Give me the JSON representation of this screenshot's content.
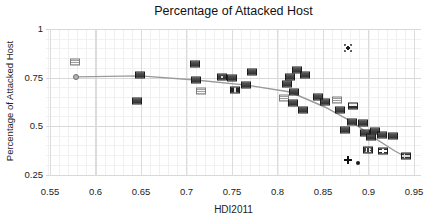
{
  "chart": {
    "title": "Percentage of Attacked Host",
    "xlabel": "HDI2011",
    "ylabel": "Percentage of Attacked Host",
    "x_tick_labels": [
      "0.55",
      "0.6",
      "0.65",
      "0.7",
      "0.75",
      "0.8",
      "0.85",
      "0.9",
      "0.95"
    ],
    "y_tick_labels": [
      "1",
      "0.75",
      "0.5",
      "0.25"
    ],
    "colors": {
      "background": "#ffffff",
      "grid_minor": "#f0f0f0",
      "grid_major": "#dcdcdc",
      "trend_line": "#9a9a9a",
      "text": "#1a1a1a",
      "flag_dark": "#3d3d3d",
      "flag_light": "#eeeeee"
    }
  },
  "chart_data": {
    "type": "scatter",
    "title": "Percentage of Attacked Host",
    "xlabel": "HDI2011",
    "ylabel": "Percentage of Attacked Host",
    "xlim": [
      0.545,
      0.958
    ],
    "ylim": [
      0.2425,
      1.0
    ],
    "x_ticks": [
      0.55,
      0.6,
      0.65,
      0.7,
      0.75,
      0.8,
      0.85,
      0.9,
      0.95
    ],
    "y_ticks": [
      1,
      0.75,
      0.5,
      0.25
    ],
    "grid": "on",
    "legend": "none",
    "marker_style": "country-flag-icons",
    "trend_line": {
      "color": "#9a9a9a",
      "points": [
        [
          0.579,
          0.753
        ],
        [
          0.649,
          0.758
        ],
        [
          0.71,
          0.737
        ],
        [
          0.766,
          0.711
        ],
        [
          0.814,
          0.675
        ],
        [
          0.852,
          0.598
        ],
        [
          0.882,
          0.521
        ],
        [
          0.905,
          0.443
        ],
        [
          0.929,
          0.371
        ],
        [
          0.943,
          0.335
        ]
      ]
    },
    "points": [
      {
        "x": 0.577,
        "y": 0.83,
        "marker": "flag-hstripes-light"
      },
      {
        "x": 0.579,
        "y": 0.753,
        "marker": "circle"
      },
      {
        "x": 0.649,
        "y": 0.763,
        "marker": "flag-dark"
      },
      {
        "x": 0.646,
        "y": 0.629,
        "marker": "flag-dark"
      },
      {
        "x": 0.709,
        "y": 0.82,
        "marker": "flag-dark"
      },
      {
        "x": 0.71,
        "y": 0.737,
        "marker": "flag-dark"
      },
      {
        "x": 0.716,
        "y": 0.68,
        "marker": "flag-hstripes-light"
      },
      {
        "x": 0.739,
        "y": 0.753,
        "marker": "flag-dark-emblem"
      },
      {
        "x": 0.75,
        "y": 0.747,
        "marker": "flag-dark"
      },
      {
        "x": 0.753,
        "y": 0.686,
        "marker": "flag-vstripes"
      },
      {
        "x": 0.772,
        "y": 0.778,
        "marker": "flag-dark"
      },
      {
        "x": 0.765,
        "y": 0.711,
        "marker": "flag-dark"
      },
      {
        "x": 0.814,
        "y": 0.753,
        "marker": "flag-dark"
      },
      {
        "x": 0.821,
        "y": 0.789,
        "marker": "flag-dark"
      },
      {
        "x": 0.83,
        "y": 0.763,
        "marker": "flag-dark"
      },
      {
        "x": 0.81,
        "y": 0.716,
        "marker": "flag-dark"
      },
      {
        "x": 0.818,
        "y": 0.675,
        "marker": "flag-dark"
      },
      {
        "x": 0.807,
        "y": 0.644,
        "marker": "flag-hstripes-light"
      },
      {
        "x": 0.817,
        "y": 0.619,
        "marker": "flag-dark"
      },
      {
        "x": 0.828,
        "y": 0.582,
        "marker": "flag-dark"
      },
      {
        "x": 0.845,
        "y": 0.649,
        "marker": "flag-dark"
      },
      {
        "x": 0.852,
        "y": 0.624,
        "marker": "flag-dark"
      },
      {
        "x": 0.865,
        "y": 0.634,
        "marker": "flag-hstripes-light"
      },
      {
        "x": 0.869,
        "y": 0.582,
        "marker": "flag-dark"
      },
      {
        "x": 0.883,
        "y": 0.603,
        "marker": "flag-white-top"
      },
      {
        "x": 0.874,
        "y": 0.479,
        "marker": "flag-dark"
      },
      {
        "x": 0.882,
        "y": 0.521,
        "marker": "flag-dark"
      },
      {
        "x": 0.894,
        "y": 0.515,
        "marker": "flag-dark"
      },
      {
        "x": 0.896,
        "y": 0.464,
        "marker": "flag-dark"
      },
      {
        "x": 0.903,
        "y": 0.443,
        "marker": "flag-dark"
      },
      {
        "x": 0.907,
        "y": 0.474,
        "marker": "flag-dark"
      },
      {
        "x": 0.915,
        "y": 0.454,
        "marker": "flag-dark"
      },
      {
        "x": 0.927,
        "y": 0.448,
        "marker": "flag-dark"
      },
      {
        "x": 0.899,
        "y": 0.376,
        "marker": "flag-dotted"
      },
      {
        "x": 0.916,
        "y": 0.371,
        "marker": "flag-cross-white"
      },
      {
        "x": 0.941,
        "y": 0.345,
        "marker": "flag-nordic"
      },
      {
        "x": 0.877,
        "y": 0.902,
        "marker": "star"
      },
      {
        "x": 0.877,
        "y": 0.325,
        "marker": "plus"
      },
      {
        "x": 0.888,
        "y": 0.309,
        "marker": "dot"
      }
    ]
  }
}
